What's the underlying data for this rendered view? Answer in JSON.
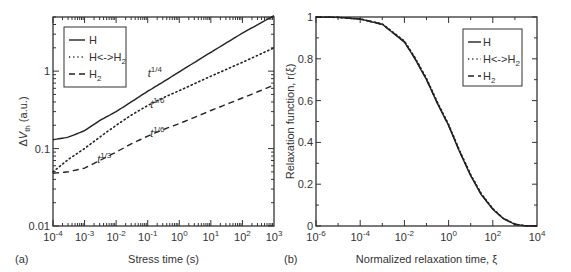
{
  "chart_data": [
    {
      "type": "line",
      "panel_label": "(a)",
      "xlabel": "Stress time  (s)",
      "ylabel": "ΔV_th (a.u.)",
      "xscale": "log",
      "yscale": "log",
      "xlim": [
        0.0001,
        1000
      ],
      "ylim": [
        0.01,
        5
      ],
      "x_ticks": [
        {
          "value": 0.0001,
          "label": "10",
          "exp": "-4"
        },
        {
          "value": 0.001,
          "label": "10",
          "exp": "-3"
        },
        {
          "value": 0.01,
          "label": "10",
          "exp": "-2"
        },
        {
          "value": 0.1,
          "label": "10",
          "exp": "-1"
        },
        {
          "value": 1,
          "label": "10",
          "exp": "0"
        },
        {
          "value": 10,
          "label": "10",
          "exp": "1"
        },
        {
          "value": 100,
          "label": "10",
          "exp": "2"
        },
        {
          "value": 1000,
          "label": "10",
          "exp": "3"
        }
      ],
      "y_ticks": [
        {
          "value": 0.01,
          "label": "0.01"
        },
        {
          "value": 0.1,
          "label": "0.1"
        },
        {
          "value": 1,
          "label": "1"
        }
      ],
      "legend_position": "top-left",
      "series": [
        {
          "name": "H",
          "style": "solid",
          "x": [
            0.0001,
            0.0003,
            0.001,
            0.003,
            0.01,
            0.03,
            0.1,
            0.3,
            1,
            10,
            100,
            1000
          ],
          "y": [
            0.13,
            0.14,
            0.17,
            0.23,
            0.3,
            0.4,
            0.55,
            0.72,
            0.98,
            1.75,
            3.1,
            5.2
          ]
        },
        {
          "name": "H<->H2",
          "style": "dotted",
          "x": [
            0.0001,
            0.0003,
            0.001,
            0.003,
            0.01,
            0.03,
            0.1,
            0.3,
            1,
            10,
            100,
            1000
          ],
          "y": [
            0.05,
            0.072,
            0.1,
            0.14,
            0.2,
            0.27,
            0.36,
            0.45,
            0.56,
            0.86,
            1.3,
            2.0
          ]
        },
        {
          "name": "H2",
          "style": "dashed",
          "x": [
            0.0001,
            0.0003,
            0.001,
            0.003,
            0.01,
            0.03,
            0.1,
            0.3,
            1,
            10,
            100,
            1000
          ],
          "y": [
            0.048,
            0.05,
            0.056,
            0.07,
            0.09,
            0.115,
            0.145,
            0.175,
            0.21,
            0.31,
            0.45,
            0.66
          ]
        }
      ],
      "annotations": [
        {
          "text": "t",
          "exp": "1/4",
          "x": 0.1,
          "y": 0.85
        },
        {
          "text": "t",
          "exp": "1/6",
          "x": 0.12,
          "y": 0.33
        },
        {
          "text": "t",
          "exp": "1/6",
          "x": 0.12,
          "y": 0.14
        },
        {
          "text": "t",
          "exp": "1/3",
          "x": 0.0025,
          "y": 0.065
        }
      ]
    },
    {
      "type": "line",
      "panel_label": "(b)",
      "xlabel": "Normalized relaxation time, ξ",
      "ylabel": "Relaxation function, r(ξ)",
      "xscale": "log",
      "yscale": "linear",
      "xlim": [
        1e-06,
        10000
      ],
      "ylim": [
        0,
        1
      ],
      "x_ticks": [
        {
          "value": 1e-06,
          "label": "10",
          "exp": "-6"
        },
        {
          "value": 0.0001,
          "label": "10",
          "exp": "-4"
        },
        {
          "value": 0.01,
          "label": "10",
          "exp": "-2"
        },
        {
          "value": 1,
          "label": "10",
          "exp": "0"
        },
        {
          "value": 100,
          "label": "10",
          "exp": "2"
        },
        {
          "value": 10000,
          "label": "10",
          "exp": "4"
        }
      ],
      "y_ticks": [
        {
          "value": 0,
          "label": "0"
        },
        {
          "value": 0.2,
          "label": "0.2"
        },
        {
          "value": 0.4,
          "label": "0.4"
        },
        {
          "value": 0.6,
          "label": "0.6"
        },
        {
          "value": 0.8,
          "label": "0.8"
        },
        {
          "value": 1,
          "label": "1"
        }
      ],
      "legend_position": "top-right",
      "series": [
        {
          "name": "H",
          "style": "solid",
          "x": [
            1e-06,
            1e-05,
            0.0001,
            0.001,
            0.01,
            0.03,
            0.1,
            0.3,
            1,
            3,
            10,
            30,
            100,
            300,
            1000,
            3000,
            10000
          ],
          "y": [
            1.0,
            0.998,
            0.99,
            0.965,
            0.88,
            0.8,
            0.7,
            0.59,
            0.48,
            0.36,
            0.24,
            0.15,
            0.08,
            0.035,
            0.008,
            0.001,
            0.0
          ]
        },
        {
          "name": "H<->H2",
          "style": "dotted",
          "x": [
            1e-06,
            1e-05,
            0.0001,
            0.001,
            0.01,
            0.03,
            0.1,
            0.3,
            1,
            3,
            10,
            30,
            100,
            300,
            1000,
            3000,
            10000
          ],
          "y": [
            1.0,
            0.998,
            0.991,
            0.967,
            0.885,
            0.806,
            0.706,
            0.596,
            0.486,
            0.366,
            0.246,
            0.155,
            0.083,
            0.037,
            0.009,
            0.001,
            0.0
          ]
        },
        {
          "name": "H2",
          "style": "dashed",
          "x": [
            1e-06,
            1e-05,
            0.0001,
            0.001,
            0.01,
            0.03,
            0.1,
            0.3,
            1,
            3,
            10,
            30,
            100,
            300,
            1000,
            3000,
            10000
          ],
          "y": [
            1.0,
            0.998,
            0.99,
            0.965,
            0.882,
            0.802,
            0.702,
            0.592,
            0.482,
            0.362,
            0.242,
            0.152,
            0.081,
            0.036,
            0.008,
            0.001,
            0.0
          ]
        }
      ],
      "annotations": []
    }
  ]
}
